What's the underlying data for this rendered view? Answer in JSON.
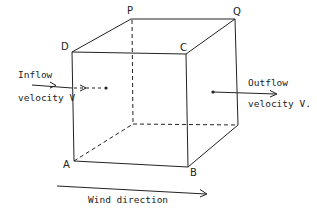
{
  "diagram": {
    "type": "cube control volume",
    "vertices": {
      "A": "A",
      "B": "B",
      "C": "C",
      "D": "D",
      "P": "P",
      "Q": "Q"
    },
    "inflow": {
      "line1": "Inflow",
      "line2": "velocity V"
    },
    "outflow": {
      "line1": "Outflow",
      "line2": "velocity V."
    },
    "wind": {
      "label": "Wind direction"
    },
    "colors": {
      "stroke": "#222222",
      "background": "#ffffff"
    }
  }
}
